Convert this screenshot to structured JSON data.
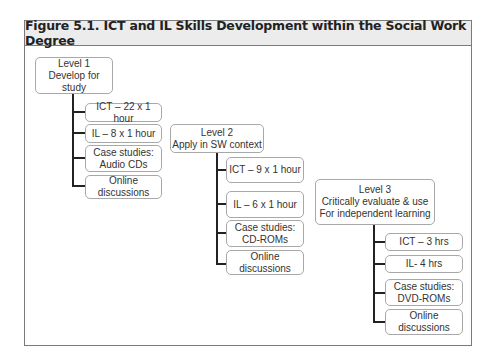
{
  "figure": {
    "title": "Figure 5.1.  ICT and IL Skills Development within the Social Work Degree"
  },
  "levels": [
    {
      "heading": "Level 1\nDevelop for study",
      "items": [
        "ICT – 22 x 1 hour",
        "IL – 8 x 1 hour",
        "Case studies:\nAudio CDs",
        "Online discussions"
      ]
    },
    {
      "heading": "Level 2\nApply in SW context",
      "items": [
        "ICT – 9 x 1 hour",
        "IL – 6 x 1 hour",
        "Case studies:\nCD-ROMs",
        "Online discussions"
      ]
    },
    {
      "heading": "Level 3\nCritically evaluate & use\nFor independent learning",
      "items": [
        "ICT – 3 hrs",
        "IL- 4 hrs",
        "Case studies:\nDVD-ROMs",
        "Online discussions"
      ]
    }
  ]
}
